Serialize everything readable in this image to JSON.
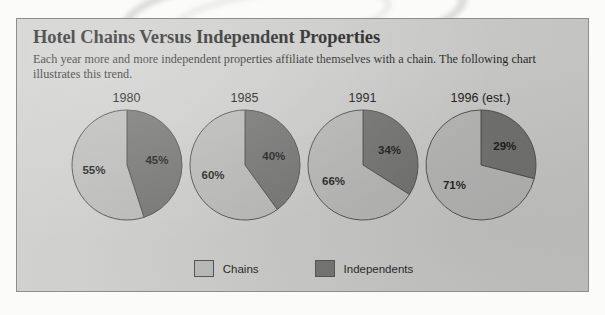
{
  "header": {
    "title": "Hotel Chains Versus Independent Properties",
    "subtitle": "Each year more and more independent properties affiliate themselves with a chain. The following chart illustrates this trend."
  },
  "colors": {
    "chains": "#b9b9b7",
    "independents": "#6e6e6c",
    "panel_background": "#cdcdcb",
    "outline": "#4a4a4a",
    "text": "#141414"
  },
  "legend": {
    "position": "bottom-center",
    "items": [
      {
        "label": "Chains",
        "color": "#b9b9b7"
      },
      {
        "label": "Independents",
        "color": "#6e6e6c"
      }
    ]
  },
  "chart_data": {
    "type": "pie",
    "title": "Hotel Chains Versus Independent Properties",
    "subtitle": "Each year more and more independent properties affiliate themselves with a chain. The following chart illustrates this trend.",
    "xlabel": "",
    "ylabel": "",
    "unit": "%",
    "legend": [
      "Chains",
      "Independents"
    ],
    "categories": [
      "Chains",
      "Independents"
    ],
    "panels": [
      {
        "label": "1980",
        "slices": [
          {
            "name": "Chains",
            "value": 55,
            "display": "55%",
            "color": "#b9b9b7"
          },
          {
            "name": "Independents",
            "value": 45,
            "display": "45%",
            "color": "#6e6e6c"
          }
        ]
      },
      {
        "label": "1985",
        "slices": [
          {
            "name": "Chains",
            "value": 60,
            "display": "60%",
            "color": "#b9b9b7"
          },
          {
            "name": "Independents",
            "value": 40,
            "display": "40%",
            "color": "#6e6e6c"
          }
        ]
      },
      {
        "label": "1991",
        "slices": [
          {
            "name": "Chains",
            "value": 66,
            "display": "66%",
            "color": "#b9b9b7"
          },
          {
            "name": "Independents",
            "value": 34,
            "display": "34%",
            "color": "#6e6e6c"
          }
        ]
      },
      {
        "label": "1996 (est.)",
        "slices": [
          {
            "name": "Chains",
            "value": 71,
            "display": "71%",
            "color": "#b9b9b7"
          },
          {
            "name": "Independents",
            "value": 29,
            "display": "29%",
            "color": "#6e6e6c"
          }
        ]
      }
    ]
  }
}
